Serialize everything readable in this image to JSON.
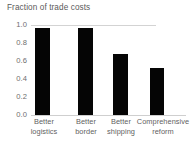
{
  "chart_data": {
    "type": "bar",
    "title": "Fraction of trade costs",
    "xlabel": "",
    "ylabel": "",
    "categories": [
      "Better logistics",
      "Better border",
      "Better shipping",
      "Comprehensive reform"
    ],
    "category_lines": [
      [
        "Better",
        "logistics"
      ],
      [
        "Better",
        "border"
      ],
      [
        "Better",
        "shipping"
      ],
      [
        "Comprehensive",
        "reform"
      ]
    ],
    "values": [
      0.97,
      0.97,
      0.68,
      0.52
    ],
    "ylim": [
      0.0,
      1.0
    ],
    "yticks": [
      "1.0",
      "0.8",
      "0.6",
      "0.4",
      "0.2",
      "0.0"
    ],
    "ytick_values": [
      1.0,
      0.8,
      0.6,
      0.4,
      0.2,
      0.0
    ],
    "grid": "top-line-only",
    "legend": "none",
    "bar_color": "#050505",
    "gridline_color": "#d3d3d3",
    "axis_color": "#cfcfcf",
    "title_color": "#5a5a5a",
    "tick_label_color": "#6e6e6e"
  }
}
